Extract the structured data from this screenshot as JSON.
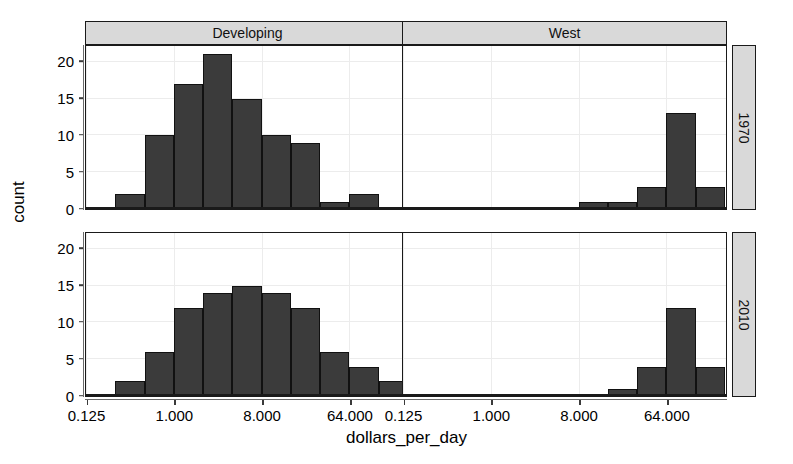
{
  "chart_data": {
    "type": "bar",
    "title": "",
    "subtitle": "",
    "xlabel": "dollars_per_day",
    "ylabel": "count",
    "grid": true,
    "legend": "none",
    "facet": {
      "col_variable": "group",
      "row_variable": "year",
      "col_labels": [
        "Developing",
        "West"
      ],
      "row_labels": [
        "1970",
        "2010"
      ]
    },
    "xscale": "log2",
    "xlim": [
      0.125,
      256
    ],
    "xticks": [
      0.125,
      1.0,
      8.0,
      64.0
    ],
    "xtick_labels": [
      "0.125",
      "1.000",
      "8.000",
      "64.000"
    ],
    "ylim": [
      0,
      22
    ],
    "yticks": [
      0,
      5,
      10,
      15,
      20
    ],
    "ytick_labels": [
      "0",
      "5",
      "10",
      "15",
      "20"
    ],
    "bin_width_log2": 1,
    "panels": [
      {
        "col": "Developing",
        "row": "1970",
        "bins": [
          {
            "x0": 0.25,
            "x1": 0.5,
            "count": 2
          },
          {
            "x0": 0.5,
            "x1": 1.0,
            "count": 10
          },
          {
            "x0": 1.0,
            "x1": 2.0,
            "count": 17
          },
          {
            "x0": 2.0,
            "x1": 4.0,
            "count": 21
          },
          {
            "x0": 4.0,
            "x1": 8.0,
            "count": 15
          },
          {
            "x0": 8.0,
            "x1": 16.0,
            "count": 10
          },
          {
            "x0": 16.0,
            "x1": 32.0,
            "count": 9
          },
          {
            "x0": 32.0,
            "x1": 64.0,
            "count": 1
          },
          {
            "x0": 64.0,
            "x1": 128.0,
            "count": 2
          }
        ]
      },
      {
        "col": "West",
        "row": "1970",
        "bins": [
          {
            "x0": 8.0,
            "x1": 16.0,
            "count": 1
          },
          {
            "x0": 16.0,
            "x1": 32.0,
            "count": 1
          },
          {
            "x0": 32.0,
            "x1": 64.0,
            "count": 3
          },
          {
            "x0": 64.0,
            "x1": 128.0,
            "count": 13
          },
          {
            "x0": 128.0,
            "x1": 256.0,
            "count": 3
          }
        ]
      },
      {
        "col": "Developing",
        "row": "2010",
        "bins": [
          {
            "x0": 0.25,
            "x1": 0.5,
            "count": 2
          },
          {
            "x0": 0.5,
            "x1": 1.0,
            "count": 6
          },
          {
            "x0": 1.0,
            "x1": 2.0,
            "count": 12
          },
          {
            "x0": 2.0,
            "x1": 4.0,
            "count": 14
          },
          {
            "x0": 4.0,
            "x1": 8.0,
            "count": 15
          },
          {
            "x0": 8.0,
            "x1": 16.0,
            "count": 14
          },
          {
            "x0": 16.0,
            "x1": 32.0,
            "count": 12
          },
          {
            "x0": 32.0,
            "x1": 64.0,
            "count": 6
          },
          {
            "x0": 64.0,
            "x1": 128.0,
            "count": 4
          },
          {
            "x0": 128.0,
            "x1": 256.0,
            "count": 2
          }
        ]
      },
      {
        "col": "West",
        "row": "2010",
        "bins": [
          {
            "x0": 16.0,
            "x1": 32.0,
            "count": 1
          },
          {
            "x0": 32.0,
            "x1": 64.0,
            "count": 4
          },
          {
            "x0": 64.0,
            "x1": 128.0,
            "count": 12
          },
          {
            "x0": 128.0,
            "x1": 256.0,
            "count": 4
          }
        ]
      }
    ],
    "colors": {
      "bar_fill": "#3b3b3b",
      "bar_stroke": "#111111",
      "panel_background": "#ffffff",
      "panel_border": "#1a1a1a",
      "strip_background": "#d9d9d9",
      "gridline": "#ececec",
      "text": "#000000"
    }
  }
}
